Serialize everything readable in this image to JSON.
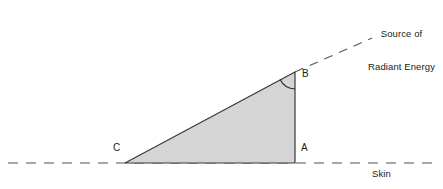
{
  "diagram": {
    "title_text": "Source of\nRadiant Energy",
    "source_label_line1": "Source of",
    "source_label_line2": "Radiant Energy",
    "skin_label": "Skin",
    "vertices": {
      "a": "A",
      "b": "B",
      "c": "C"
    },
    "colors": {
      "triangle_fill": "#d5d5d5",
      "stroke": "#3a3a3a",
      "dashed_stroke": "#555555",
      "text": "#1a1a1a",
      "background": "#ffffff"
    },
    "geometry": {
      "vertex_a": [
        295,
        163
      ],
      "vertex_b": [
        295,
        72
      ],
      "vertex_c": [
        125,
        163
      ],
      "baseline_y": 163,
      "baseline_x_start": 8,
      "baseline_x_end": 436,
      "ray_end": [
        372,
        38
      ],
      "angle_arc_radius": 17
    }
  }
}
